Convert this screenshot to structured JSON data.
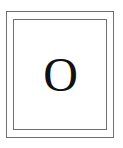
{
  "tile": {
    "letter": "O",
    "border_color": "#6e6e6e",
    "text_color": "#111111",
    "background": "#ffffff"
  }
}
